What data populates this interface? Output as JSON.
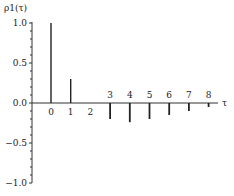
{
  "chart_data": {
    "type": "bar",
    "title": "",
    "ylabel": "ρ1(τ)",
    "xlabel": "τ",
    "categories": [
      "0",
      "1",
      "2",
      "3",
      "4",
      "5",
      "6",
      "7",
      "8"
    ],
    "values": [
      1.0,
      0.3,
      0.0,
      -0.2,
      -0.24,
      -0.2,
      -0.15,
      -0.1,
      -0.05
    ],
    "ylim": [
      -1.0,
      1.0
    ],
    "yticks": [
      "1.0",
      "0.5",
      "0.0",
      "-0.5",
      "-1.0"
    ],
    "grid": false,
    "legend": null
  }
}
